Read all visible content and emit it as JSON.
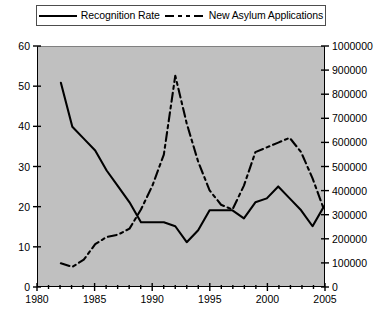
{
  "legend": {
    "entries": [
      {
        "label": "Recognition Rate",
        "style": "solid",
        "color": "#000000"
      },
      {
        "label": "New Asylum Applications",
        "style": "dash-dot",
        "color": "#000000"
      }
    ]
  },
  "axes": {
    "left_ticks": [
      "0",
      "10",
      "20",
      "30",
      "40",
      "50",
      "60"
    ],
    "right_ticks": [
      "0",
      "100000",
      "200000",
      "300000",
      "400000",
      "500000",
      "600000",
      "700000",
      "800000",
      "900000",
      "1000000"
    ],
    "x_ticks": [
      "1980",
      "1985",
      "1990",
      "1995",
      "2000",
      "2005"
    ]
  },
  "style": {
    "plot_background": "#c0c0c0",
    "axis_color": "#000000",
    "page_background": "#ffffff"
  },
  "chart_data": {
    "type": "line",
    "title": "",
    "subtitle": "",
    "xlabel": "",
    "ylabel": "Recognition Rate",
    "y2label": "New Asylum Applications",
    "grid": false,
    "legend_position": "top",
    "xlim": [
      1980,
      2005
    ],
    "ylim": [
      0,
      60
    ],
    "y2lim": [
      0,
      1000000
    ],
    "x": [
      1980,
      1981,
      1982,
      1983,
      1984,
      1985,
      1986,
      1987,
      1988,
      1989,
      1990,
      1991,
      1992,
      1993,
      1994,
      1995,
      1996,
      1997,
      1998,
      1999,
      2000,
      2001,
      2002,
      2003,
      2004,
      2005
    ],
    "xtick_values": [
      1980,
      1985,
      1990,
      1995,
      2000,
      2005
    ],
    "ytick_values": [
      0,
      10,
      20,
      30,
      40,
      50,
      60
    ],
    "y2tick_values": [
      0,
      100000,
      200000,
      300000,
      400000,
      500000,
      600000,
      700000,
      800000,
      900000,
      1000000
    ],
    "series": [
      {
        "name": "Recognition Rate",
        "axis": "left",
        "style": "solid",
        "color": "#000000",
        "x": [
          1982,
          1983,
          1984,
          1985,
          1986,
          1987,
          1988,
          1989,
          1990,
          1991,
          1992,
          1993,
          1994,
          1995,
          1996,
          1997,
          1998,
          1999,
          2000,
          2001,
          2002,
          2003,
          2004,
          2005
        ],
        "values": [
          51,
          40,
          37,
          34,
          29,
          25,
          21,
          16,
          16,
          16,
          15,
          11,
          14,
          19,
          19,
          19,
          17,
          21,
          22,
          25,
          22,
          19,
          15,
          20
        ]
      },
      {
        "name": "New Asylum Applications",
        "axis": "right",
        "style": "dash-dot",
        "color": "#000000",
        "x": [
          1982,
          1983,
          1984,
          1985,
          1986,
          1987,
          1988,
          1989,
          1990,
          1991,
          1992,
          1993,
          1994,
          1995,
          1996,
          1997,
          1998,
          1999,
          2000,
          2001,
          2002,
          2003,
          2004,
          2005
        ],
        "values": [
          95000,
          80000,
          110000,
          175000,
          205000,
          215000,
          240000,
          320000,
          420000,
          550000,
          880000,
          680000,
          520000,
          400000,
          340000,
          320000,
          420000,
          560000,
          580000,
          600000,
          620000,
          560000,
          450000,
          320000
        ]
      }
    ]
  }
}
